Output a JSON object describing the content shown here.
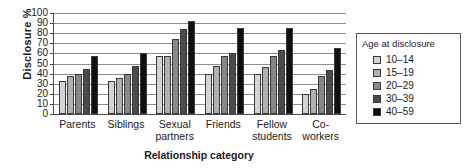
{
  "chart_data": {
    "type": "bar",
    "title": "",
    "subtitle": "",
    "xlabel": "Relationship category",
    "ylabel": "Disclosure %",
    "ylim": [
      0,
      100
    ],
    "ytick_step": 10,
    "yticks": [
      100,
      90,
      80,
      70,
      60,
      50,
      40,
      30,
      20,
      10,
      0
    ],
    "grid": true,
    "grid_axis": "y",
    "legend_position": "right",
    "legend_title": "Age at disclosure",
    "categories": [
      "Parents",
      "Siblings",
      "Sexual\npartners",
      "Friends",
      "Fellow\nstudents",
      "Co-workers"
    ],
    "series": [
      {
        "name": "10–14",
        "color": "#d4d4d4",
        "values": [
          33,
          33,
          57,
          40,
          40,
          20
        ]
      },
      {
        "name": "15–19",
        "color": "#b0b0b0",
        "values": [
          38,
          36,
          57,
          48,
          47,
          25
        ]
      },
      {
        "name": "20–29",
        "color": "#888888",
        "values": [
          40,
          40,
          74,
          57,
          57,
          38
        ]
      },
      {
        "name": "30–39",
        "color": "#4a4a4a",
        "values": [
          45,
          48,
          84,
          60,
          63,
          44
        ]
      },
      {
        "name": "40–59",
        "color": "#101010",
        "values": [
          57,
          60,
          92,
          85,
          85,
          65
        ]
      }
    ]
  },
  "colors": {
    "axis": "#4a4a4a",
    "grid": "#8d8d8d",
    "text": "#1a1a1a",
    "background": "#ffffff",
    "legend_border": "#5a5a5a"
  }
}
